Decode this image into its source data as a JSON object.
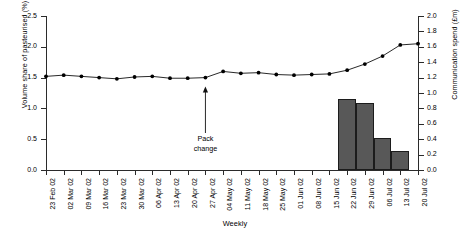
{
  "chart_data": {
    "type": "bar",
    "title": "",
    "xlabel": "Weekly",
    "categories": [
      "23 Feb 02",
      "02 Mar 02",
      "09 Mar 02",
      "16 Mar 02",
      "23 Mar 02",
      "30 Mar 02",
      "06 Apr 02",
      "13 Apr 02",
      "20 Apr 02",
      "27 Apr 02",
      "04 May 02",
      "11 May 02",
      "18 May 02",
      "25 May 02",
      "01 Jun 02",
      "08 Jun 02",
      "15 Jun 02",
      "22 Jun 02",
      "29 Jun 02",
      "06 Jul 02",
      "13 Jul 02",
      "20 Jul 02"
    ],
    "series": [
      {
        "name": "Volume share of pasteurised (%)",
        "type": "line",
        "axis": "left",
        "marker": "filled-circle",
        "color": "#000000",
        "values": [
          1.52,
          1.54,
          1.52,
          1.5,
          1.48,
          1.51,
          1.52,
          1.49,
          1.49,
          1.5,
          1.6,
          1.57,
          1.58,
          1.55,
          1.54,
          1.55,
          1.56,
          1.62,
          1.72,
          1.85,
          2.03,
          2.05
        ]
      },
      {
        "name": "Communication spend (£m)",
        "type": "bar",
        "axis": "right",
        "color": "#585858",
        "values": [
          0,
          0,
          0,
          0,
          0,
          0,
          0,
          0,
          0,
          0,
          0,
          0,
          0,
          0,
          0,
          0,
          0,
          0.92,
          0.87,
          0.42,
          0.25,
          0
        ]
      }
    ],
    "yaxis_left": {
      "label": "Volume share of pasteurised (%)",
      "ticks": [
        "0.0",
        "0.5",
        "1.0",
        "1.5",
        "2.0",
        "2.5"
      ],
      "ylim": [
        0.0,
        2.5
      ]
    },
    "yaxis_right": {
      "label": "Communication spend (£m)",
      "ticks": [
        "0.0",
        "0.2",
        "0.4",
        "0.6",
        "0.8",
        "1.0",
        "1.2",
        "1.4",
        "1.6",
        "1.8",
        "2.0"
      ],
      "ylim": [
        0.0,
        2.0
      ]
    },
    "grid": false,
    "legend": "none",
    "annotations": [
      {
        "name": "pack-change",
        "line1": "Pack",
        "line2": "change",
        "at_category": "27 Apr 02",
        "arrow": "up"
      }
    ]
  }
}
